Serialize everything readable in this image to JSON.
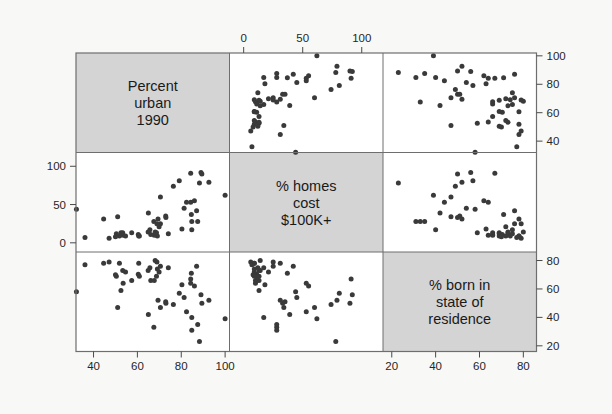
{
  "figure": {
    "kind": "scatterplot-matrix",
    "background_color": "#f8f8f7",
    "diagonal_panel_color": "#d4d4d4",
    "panel_color": "#ffffff",
    "point_color": "#3a3a3a",
    "frame_color": "#6e6e6e"
  },
  "variables": [
    {
      "key": "urban",
      "label_lines": [
        "Percent",
        "urban",
        "1990"
      ]
    },
    {
      "key": "homes",
      "label_lines": [
        "% homes",
        "cost",
        "$100K+"
      ]
    },
    {
      "key": "born",
      "label_lines": [
        "% born in",
        "state of",
        "residence"
      ]
    }
  ],
  "axes": {
    "top": {
      "for": "homes",
      "position": "top",
      "ticks": [
        "0",
        "50",
        "100"
      ],
      "values": [
        0,
        50,
        100
      ]
    },
    "right_row1": {
      "for": "urban",
      "position": "right",
      "ticks": [
        "100",
        "80",
        "60",
        "40"
      ],
      "values": [
        100,
        80,
        60,
        40
      ]
    },
    "left_row2": {
      "for": "homes",
      "position": "left",
      "ticks": [
        "100",
        "50",
        "0"
      ],
      "values": [
        100,
        50,
        0
      ]
    },
    "right_row3": {
      "for": "born",
      "position": "right",
      "ticks": [
        "80",
        "60",
        "40",
        "20"
      ],
      "values": [
        80,
        60,
        40,
        20
      ]
    },
    "bottom_col1": {
      "for": "urban",
      "position": "bottom",
      "ticks": [
        "40",
        "60",
        "80",
        "100"
      ],
      "values": [
        40,
        60,
        80,
        100
      ]
    },
    "bottom_col3": {
      "for": "born",
      "position": "bottom",
      "ticks": [
        "20",
        "40",
        "60",
        "80"
      ],
      "values": [
        20,
        40,
        60,
        80
      ]
    }
  },
  "chart_data": {
    "type": "scatter",
    "title": "",
    "subtitle": "",
    "matrix": true,
    "variables": [
      "urban",
      "homes",
      "born"
    ],
    "variable_labels": {
      "urban": "Percent urban 1990",
      "homes": "% homes cost $100K+",
      "born": "% born in state of residence"
    },
    "axis_ranges": {
      "urban": [
        32,
        102
      ],
      "homes": [
        -12,
        118
      ],
      "born": [
        16,
        86
      ]
    },
    "legend": "none",
    "grid": false,
    "points": [
      {
        "urban": 60.4,
        "homes": 11.0,
        "born": 70.4
      },
      {
        "urban": 67.5,
        "homes": 28.0,
        "born": 33.0
      },
      {
        "urban": 87.5,
        "homes": 28.0,
        "born": 35.0
      },
      {
        "urban": 53.5,
        "homes": 10.0,
        "born": 64.0
      },
      {
        "urban": 92.6,
        "homes": 79.0,
        "born": 52.0
      },
      {
        "urban": 82.4,
        "homes": 53.0,
        "born": 44.0
      },
      {
        "urban": 79.1,
        "homes": 81.0,
        "born": 57.0
      },
      {
        "urban": 73.0,
        "homes": 33.0,
        "born": 50.0
      },
      {
        "urban": 84.8,
        "homes": 28.0,
        "born": 31.0
      },
      {
        "urban": 84.8,
        "homes": 17.0,
        "born": 40.0
      },
      {
        "urban": 89.0,
        "homes": 92.0,
        "born": 56.0
      },
      {
        "urban": 57.4,
        "homes": 13.0,
        "born": 66.0
      },
      {
        "urban": 84.6,
        "homes": 37.0,
        "born": 71.0
      },
      {
        "urban": 64.9,
        "homes": 14.0,
        "born": 73.0
      },
      {
        "urban": 60.6,
        "homes": 9.0,
        "born": 78.0
      },
      {
        "urban": 69.1,
        "homes": 9.0,
        "born": 74.0
      },
      {
        "urban": 51.8,
        "homes": 9.0,
        "born": 78.0
      },
      {
        "urban": 68.1,
        "homes": 14.0,
        "born": 80.0
      },
      {
        "urban": 44.6,
        "homes": 31.0,
        "born": 78.0
      },
      {
        "urban": 81.3,
        "homes": 45.0,
        "born": 54.0
      },
      {
        "urban": 84.3,
        "homes": 53.0,
        "born": 64.0
      },
      {
        "urban": 70.5,
        "homes": 25.0,
        "born": 76.0
      },
      {
        "urban": 69.9,
        "homes": 21.0,
        "born": 72.0
      },
      {
        "urban": 47.1,
        "homes": 6.0,
        "born": 79.0
      },
      {
        "urban": 68.7,
        "homes": 13.0,
        "born": 69.0
      },
      {
        "urban": 52.5,
        "homes": 13.0,
        "born": 59.0
      },
      {
        "urban": 66.1,
        "homes": 11.0,
        "born": 66.0
      },
      {
        "urban": 88.3,
        "homes": 78.0,
        "born": 23.0
      },
      {
        "urban": 51.0,
        "homes": 34.0,
        "born": 47.0
      },
      {
        "urban": 89.4,
        "homes": 90.0,
        "born": 50.0
      },
      {
        "urban": 72.9,
        "homes": 35.0,
        "born": 51.0
      },
      {
        "urban": 84.3,
        "homes": 91.0,
        "born": 67.0
      },
      {
        "urban": 50.4,
        "homes": 12.0,
        "born": 69.0
      },
      {
        "urban": 53.3,
        "homes": 13.0,
        "born": 73.0
      },
      {
        "urban": 74.1,
        "homes": 12.0,
        "born": 75.0
      },
      {
        "urban": 67.7,
        "homes": 10.0,
        "born": 66.0
      },
      {
        "urban": 70.5,
        "homes": 60.0,
        "born": 47.0
      },
      {
        "urban": 68.9,
        "homes": 25.0,
        "born": 79.0
      },
      {
        "urban": 86.0,
        "homes": 55.0,
        "born": 62.0
      },
      {
        "urban": 54.6,
        "homes": 9.0,
        "born": 72.0
      },
      {
        "urban": 50.0,
        "homes": 8.0,
        "born": 70.0
      },
      {
        "urban": 60.9,
        "homes": 9.0,
        "born": 69.0
      },
      {
        "urban": 80.3,
        "homes": 18.0,
        "born": 63.0
      },
      {
        "urban": 87.0,
        "homes": 42.0,
        "born": 76.0
      },
      {
        "urban": 32.2,
        "homes": 44.0,
        "born": 58.0
      },
      {
        "urban": 69.4,
        "homes": 31.0,
        "born": 52.0
      },
      {
        "urban": 76.4,
        "homes": 74.0,
        "born": 49.0
      },
      {
        "urban": 36.1,
        "homes": 7.0,
        "born": 77.0
      },
      {
        "urban": 65.7,
        "homes": 17.0,
        "born": 75.0
      },
      {
        "urban": 65.0,
        "homes": 39.0,
        "born": 42.0
      },
      {
        "urban": 100.0,
        "homes": 62.0,
        "born": 39.0
      }
    ]
  }
}
